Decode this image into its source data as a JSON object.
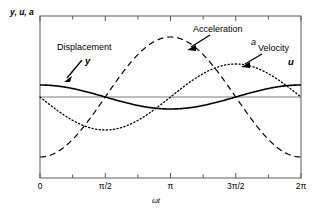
{
  "chart_data": {
    "type": "line",
    "title": "",
    "xlabel": "ωt",
    "ylabel": "y, u, a",
    "xlim": [
      0,
      6.283185307179586
    ],
    "ylim": [
      -1.35,
      1.35
    ],
    "grid": false,
    "legend_position": "inline-annotations",
    "x_tick_labels": [
      "0",
      "π/2",
      "π",
      "3π/2",
      "2π"
    ],
    "x_tick_values": [
      0,
      1.5707963,
      3.1415927,
      4.712389,
      6.2831853
    ],
    "x_minor_tick_values": [
      0.7853982,
      2.3561945,
      3.9269908,
      5.4977871
    ],
    "y_tick_labels": [],
    "zero_line": 0,
    "series": [
      {
        "name": "Displacement",
        "symbol": "y",
        "function": "cos",
        "amplitude": 0.2,
        "phase": 0,
        "style": "solid",
        "color": "#000000",
        "width": 1.5
      },
      {
        "name": "Velocity",
        "symbol": "u",
        "function": "-sin",
        "amplitude": 0.55,
        "phase": 0,
        "style": "dotted",
        "color": "#000000",
        "width": 1.2
      },
      {
        "name": "Acceleration",
        "symbol": "a",
        "function": "-cos",
        "amplitude": 1.0,
        "phase": 0,
        "style": "dashed",
        "color": "#000000",
        "width": 1.2
      }
    ],
    "annotations": [
      {
        "text": "Displacement",
        "symbol": "y",
        "points_to": "displacement-curve"
      },
      {
        "text": "Acceleration",
        "symbol": "a",
        "points_to": "acceleration-curve"
      },
      {
        "text": "Velocity",
        "symbol": "u",
        "points_to": "velocity-curve"
      }
    ]
  },
  "axes": {
    "y_axis_label": "y, u, a",
    "x_axis_label": "ωt",
    "ticks": [
      {
        "label": "0"
      },
      {
        "label": "π/2"
      },
      {
        "label": "π"
      },
      {
        "label": "3π/2"
      },
      {
        "label": "2π"
      }
    ]
  },
  "labels": {
    "displacement_title": "Displacement",
    "displacement_symbol": "y",
    "acceleration_title": "Acceleration",
    "acceleration_symbol": "a",
    "velocity_title": "Velocity",
    "velocity_symbol": "u"
  },
  "colors": {
    "ink": "#000000",
    "frame": "#5a5a5a",
    "zero_line": "#6e6e6e",
    "background": "#ffffff"
  }
}
